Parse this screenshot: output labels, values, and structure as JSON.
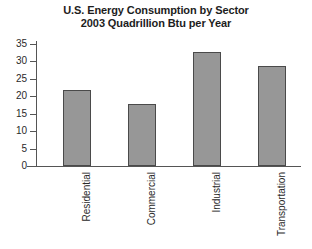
{
  "chart_data": {
    "type": "bar",
    "title": "U.S. Energy Consumption by Sector",
    "subtitle": "2003 Quadrillion Btu per Year",
    "title_lines": [
      "U.S. Energy Consumption by Sector",
      "2003 Quadrillion Btu per Year"
    ],
    "categories": [
      "Residential",
      "Commercial",
      "Industrial",
      "Transportation"
    ],
    "values": [
      21.7,
      17.7,
      32.8,
      28.6
    ],
    "xlabel": "",
    "ylabel": "",
    "ylim": [
      0,
      35
    ],
    "yticks": [
      0,
      5,
      10,
      15,
      20,
      25,
      30,
      35
    ],
    "ytick_labels": [
      "0",
      "5",
      "10",
      "15",
      "20",
      "25",
      "30",
      "35"
    ],
    "grid": false,
    "legend": false,
    "units": "Quadrillion Btu per Year",
    "bar_color": "#979797",
    "bar_edge_color": "#4a4a4a",
    "axis_color": "#555555",
    "background_color": "#ffffff",
    "xtick_label_rotation": 90
  }
}
